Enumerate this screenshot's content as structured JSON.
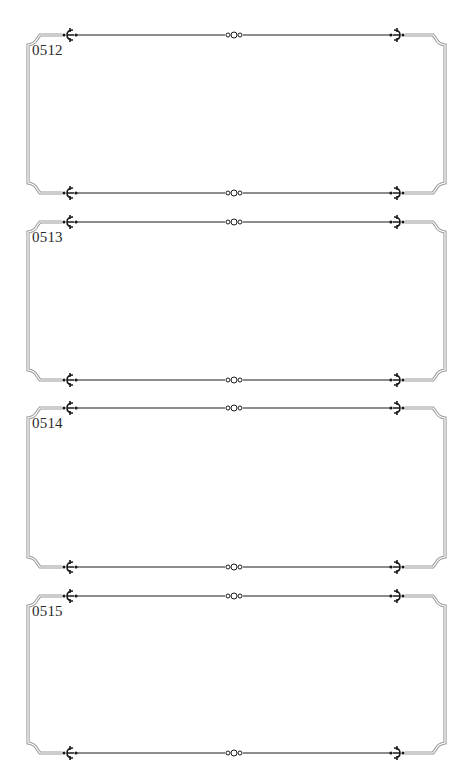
{
  "page": {
    "background": "#ffffff",
    "frame_color": "#9a9a9a",
    "ornament_color": "#1a1a1a"
  },
  "frames": [
    {
      "label": "0512",
      "top": 35,
      "bottom": 193
    },
    {
      "label": "0513",
      "top": 222,
      "bottom": 380
    },
    {
      "label": "0514",
      "top": 408,
      "bottom": 567
    },
    {
      "label": "0515",
      "top": 596,
      "bottom": 753
    }
  ],
  "ornaments": {
    "left_icon": "fleur-left-icon",
    "center_icon": "triple-circle-icon",
    "right_icon": "fleur-right-icon"
  }
}
